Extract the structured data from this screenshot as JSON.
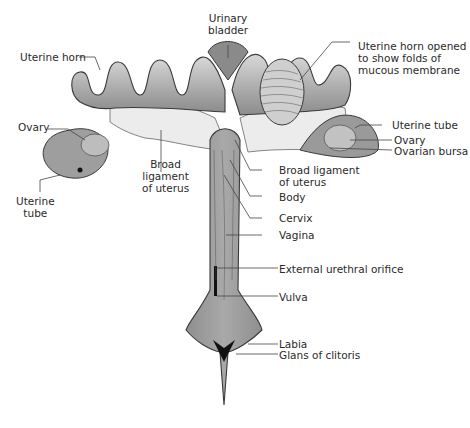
{
  "diagram": {
    "colors": {
      "tissue_dark": "#8a8a8a",
      "tissue_mid": "#a8a8a8",
      "tissue_light": "#c9c9c9",
      "ligament": "#e6e6e6",
      "outline": "#3a3a3a",
      "leader_line": "#444444",
      "text": "#2a2a2a"
    },
    "labels": {
      "urinary_bladder": "Urinary\nbladder",
      "uterine_horn_left": "Uterine horn",
      "uterine_horn_opened": "Uterine horn opened\nto show folds of\nmucous membrane",
      "ovary_left": "Ovary",
      "broad_ligament_left": "Broad\nligament\nof uterus",
      "uterine_tube_left": "Uterine\ntube",
      "uterine_tube_right": "Uterine tube",
      "ovary_right": "Ovary",
      "ovarian_bursa": "Ovarian bursa",
      "broad_ligament_right": "Broad ligament\nof uterus",
      "body": "Body",
      "cervix": "Cervix",
      "vagina": "Vagina",
      "external_urethral_orifice": "External urethral orifice",
      "vulva": "Vulva",
      "labia": "Labia",
      "glans_of_clitoris": "Glans of clitoris"
    }
  }
}
